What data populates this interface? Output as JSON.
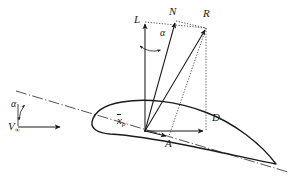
{
  "figure": {
    "background_color": "#ffffff",
    "line_color": "#1a1a1a",
    "width": 289,
    "height": 178,
    "labels": {
      "lift": "L",
      "normal": "N",
      "resultant": "R",
      "drag": "D",
      "axial": "A",
      "center_of_pressure_x": "x",
      "center_of_pressure_sub": "p",
      "alpha_top": "α",
      "alpha_left": "α",
      "freestream": "V",
      "freestream_sub": "∞"
    },
    "geometry": {
      "center_of_pressure": [
        145,
        131
      ],
      "leading_edge": [
        92,
        122
      ],
      "trailing_edge": [
        276,
        164
      ],
      "lift_tip": [
        145,
        22
      ],
      "normal_tip": [
        176,
        21
      ],
      "resultant_tip": [
        206,
        28
      ],
      "drag_tip": [
        206,
        127
      ],
      "axial_tip": [
        168,
        135
      ],
      "chord_line_start": [
        18,
        92
      ],
      "chord_line_end": [
        288,
        172
      ],
      "vinf_arrow_start": [
        18,
        127
      ],
      "vinf_arrow_end": [
        62,
        127
      ],
      "alpha_angle_degrees": 17
    }
  }
}
